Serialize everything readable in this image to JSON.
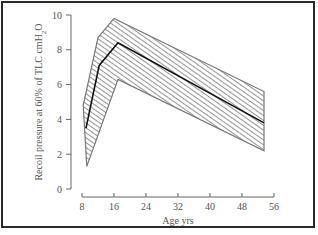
{
  "chart_data": {
    "type": "area",
    "title": "",
    "xlabel": "Age yrs",
    "ylabel": "Recoil pressure at 60% of TLC cmH2O",
    "ylabel_parts": {
      "main": "Recoil pressure at 60% of TLC cmH",
      "sub": "2",
      "tail": "O"
    },
    "xlim": [
      8,
      56
    ],
    "ylim": [
      0,
      10
    ],
    "x_ticks": [
      8,
      16,
      24,
      32,
      40,
      48,
      56
    ],
    "y_ticks": [
      0,
      2,
      4,
      6,
      8,
      10
    ],
    "grid": false,
    "legend": null,
    "series": [
      {
        "name": "Mean recoil pressure",
        "style": "line",
        "x": [
          9,
          12.3,
          17,
          53.5
        ],
        "y": [
          3.5,
          7.1,
          8.4,
          3.8
        ]
      },
      {
        "name": "Range band (upper)",
        "style": "hatched-band-upper",
        "x": [
          8.3,
          12,
          16,
          53.5
        ],
        "y": [
          4.8,
          8.7,
          9.8,
          5.6
        ]
      },
      {
        "name": "Range band (lower)",
        "style": "hatched-band-lower",
        "x": [
          9.2,
          17,
          53.5
        ],
        "y": [
          1.3,
          6.3,
          2.2
        ]
      }
    ]
  }
}
